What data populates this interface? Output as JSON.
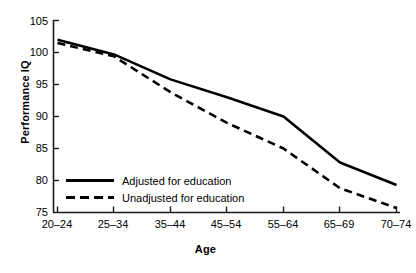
{
  "chart_data": {
    "type": "line",
    "title": "",
    "xlabel": "Age",
    "ylabel": "Performance IQ",
    "categories": [
      "20–24",
      "25–34",
      "35–44",
      "45–54",
      "55–64",
      "65–69",
      "70–74"
    ],
    "ylim": [
      75,
      105
    ],
    "yticks": [
      75,
      80,
      85,
      90,
      95,
      100,
      105
    ],
    "ytick_labels": [
      "75",
      "80",
      "85",
      "90",
      "95",
      "100",
      "105"
    ],
    "grid": false,
    "legend_position": "lower-left-inside",
    "series": [
      {
        "name": "Adjusted for education",
        "style": "solid",
        "color": "#000000",
        "values": [
          102.0,
          99.7,
          95.8,
          93.0,
          90.0,
          82.8,
          79.3
        ]
      },
      {
        "name": "Unadjusted for education",
        "style": "dashed",
        "color": "#000000",
        "values": [
          101.5,
          99.4,
          93.8,
          89.0,
          85.0,
          78.8,
          75.7
        ]
      }
    ]
  },
  "axes": {
    "y_label": "Performance IQ",
    "x_label": "Age"
  },
  "legend": {
    "items": [
      {
        "label": "Adjusted for education",
        "style": "solid"
      },
      {
        "label": "Unadjusted for education",
        "style": "dashed"
      }
    ]
  }
}
